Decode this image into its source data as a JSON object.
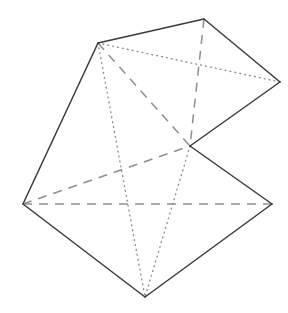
{
  "figure": {
    "canvas": {
      "width": 288,
      "height": 313,
      "background": "#ffffff"
    },
    "style": {
      "solid_color": "#3a3a42",
      "hidden_color": "#8d8d96",
      "solid_width": 1.5,
      "hidden_width": 1.5
    },
    "vertices": [
      {
        "id": "A",
        "name": "top-left",
        "x": 98,
        "y": 43
      },
      {
        "id": "B",
        "name": "top-apex",
        "x": 204,
        "y": 19
      },
      {
        "id": "C",
        "name": "right",
        "x": 280,
        "y": 82
      },
      {
        "id": "D",
        "name": "center",
        "x": 190,
        "y": 146
      },
      {
        "id": "E",
        "name": "left",
        "x": 23,
        "y": 204
      },
      {
        "id": "F",
        "name": "bottom-right",
        "x": 272,
        "y": 204
      },
      {
        "id": "G",
        "name": "bottom",
        "x": 145,
        "y": 297
      }
    ],
    "edges_solid": [
      {
        "from": "A",
        "to": "B",
        "path": "M98,43 L204,19"
      },
      {
        "from": "B",
        "to": "C",
        "path": "M204,19 L280,82"
      },
      {
        "from": "C",
        "to": "D",
        "path": "M280,82 L190,146"
      },
      {
        "from": "D",
        "to": "F",
        "path": "M190,146 L272,204"
      },
      {
        "from": "F",
        "to": "G",
        "path": "M272,204 L145,297"
      },
      {
        "from": "G",
        "to": "E",
        "path": "M145,297 L23,204"
      },
      {
        "from": "E",
        "to": "A",
        "path": "M23,204 L98,43"
      }
    ],
    "edges_dashed": [
      {
        "from": "A",
        "to": "D",
        "path": "M98,43 L190,146"
      },
      {
        "from": "B",
        "to": "D",
        "path": "M204,19 L190,146"
      },
      {
        "from": "E",
        "to": "D",
        "path": "M23,204 L190,146"
      },
      {
        "from": "E",
        "to": "F",
        "path": "M23,204 L272,204"
      }
    ],
    "edges_dotted": [
      {
        "from": "A",
        "to": "C",
        "path": "M98,43 L280,82"
      },
      {
        "from": "A",
        "to": "G",
        "path": "M98,43 L145,297"
      },
      {
        "from": "D",
        "to": "G",
        "path": "M190,146 L145,297"
      }
    ]
  }
}
